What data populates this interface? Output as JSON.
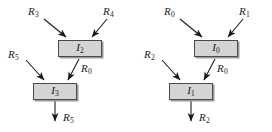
{
  "figure": {
    "type": "dependency-graph-pair",
    "background_color": "#ffffff",
    "node_fill_color": "#d4d4d4",
    "node_border_color": "#4a4a4a",
    "edge_color": "#1a1a1a"
  },
  "diagrams": [
    {
      "id": "left",
      "nodes": [
        {
          "id": "upper",
          "base": "I",
          "sub": "2"
        },
        {
          "id": "lower",
          "base": "I",
          "sub": "3"
        }
      ],
      "edges": [
        {
          "id": "input-a",
          "base": "R",
          "sub": "3",
          "role": "operand-in-upper-left"
        },
        {
          "id": "input-b",
          "base": "R",
          "sub": "4",
          "role": "operand-in-upper-right"
        },
        {
          "id": "input-c",
          "base": "R",
          "sub": "5",
          "role": "operand-in-lower-left"
        },
        {
          "id": "middle",
          "base": "R",
          "sub": "0",
          "role": "upper-to-lower"
        },
        {
          "id": "output",
          "base": "R",
          "sub": "5",
          "role": "result-out"
        }
      ]
    },
    {
      "id": "right",
      "nodes": [
        {
          "id": "upper",
          "base": "I",
          "sub": "0"
        },
        {
          "id": "lower",
          "base": "I",
          "sub": "1"
        }
      ],
      "edges": [
        {
          "id": "input-a",
          "base": "R",
          "sub": "0",
          "role": "operand-in-upper-left"
        },
        {
          "id": "input-b",
          "base": "R",
          "sub": "1",
          "role": "operand-in-upper-right"
        },
        {
          "id": "input-c",
          "base": "R",
          "sub": "2",
          "role": "operand-in-lower-left"
        },
        {
          "id": "middle",
          "base": "R",
          "sub": "0",
          "role": "upper-to-lower"
        },
        {
          "id": "output",
          "base": "R",
          "sub": "2",
          "role": "result-out"
        }
      ]
    }
  ]
}
